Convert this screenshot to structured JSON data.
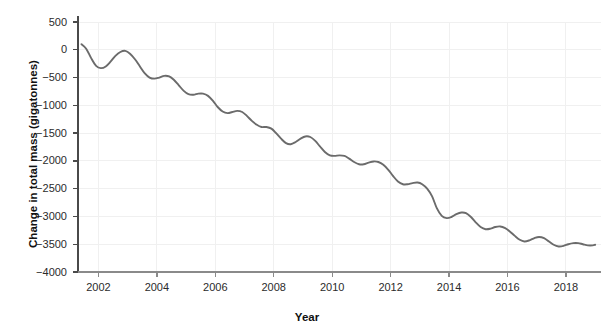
{
  "chart_data": {
    "type": "line",
    "title": "",
    "xlabel": "Year",
    "ylabel": "Change in total mass (gigatonnes)",
    "xlim": [
      2001.3,
      2019.2
    ],
    "ylim": [
      -4000,
      500
    ],
    "xticks": [
      2002,
      2004,
      2006,
      2008,
      2010,
      2012,
      2014,
      2016,
      2018
    ],
    "xtick_labels": [
      "2002",
      "2004",
      "2006",
      "2008",
      "2010",
      "2012",
      "2014",
      "2016",
      "2018"
    ],
    "yticks": [
      500,
      0,
      -500,
      -1000,
      -1500,
      -2000,
      -2500,
      -3000,
      -3500,
      -4000
    ],
    "ytick_labels": [
      "500",
      "0",
      "−500",
      "−1000",
      "−1500",
      "−2000",
      "−2500",
      "−3000",
      "−3500",
      "−4000"
    ],
    "grid": true,
    "legend": null,
    "line_color": "#6b6b6b",
    "grid_color": "#f0f0f0",
    "axis_color": "#4a4a4a",
    "series": [
      {
        "name": "Change in total mass",
        "x": [
          2001.42,
          2001.58,
          2001.75,
          2001.92,
          2002.08,
          2002.25,
          2002.42,
          2002.58,
          2002.75,
          2002.92,
          2003.08,
          2003.25,
          2003.42,
          2003.58,
          2003.75,
          2003.92,
          2004.08,
          2004.25,
          2004.42,
          2004.58,
          2004.75,
          2004.92,
          2005.08,
          2005.25,
          2005.42,
          2005.58,
          2005.75,
          2005.92,
          2006.08,
          2006.25,
          2006.42,
          2006.58,
          2006.75,
          2006.92,
          2007.08,
          2007.25,
          2007.42,
          2007.58,
          2007.75,
          2007.92,
          2008.08,
          2008.25,
          2008.42,
          2008.58,
          2008.75,
          2008.92,
          2009.08,
          2009.25,
          2009.42,
          2009.58,
          2009.75,
          2009.92,
          2010.08,
          2010.25,
          2010.42,
          2010.58,
          2010.75,
          2010.92,
          2011.08,
          2011.25,
          2011.42,
          2011.58,
          2011.75,
          2011.92,
          2012.08,
          2012.25,
          2012.42,
          2012.58,
          2012.75,
          2012.92,
          2013.08,
          2013.25,
          2013.42,
          2013.58,
          2013.75,
          2013.92,
          2014.08,
          2014.25,
          2014.42,
          2014.58,
          2014.75,
          2014.92,
          2015.08,
          2015.25,
          2015.42,
          2015.58,
          2015.75,
          2015.92,
          2016.08,
          2016.25,
          2016.42,
          2016.58,
          2016.75,
          2016.92,
          2017.08,
          2017.25,
          2017.42,
          2017.58,
          2017.75,
          2017.92,
          2018.08,
          2018.25,
          2018.42,
          2018.58,
          2018.75,
          2018.92,
          2019.0
        ],
        "y": [
          100,
          20,
          -150,
          -290,
          -330,
          -300,
          -210,
          -110,
          -40,
          -20,
          -70,
          -170,
          -300,
          -420,
          -500,
          -520,
          -500,
          -470,
          -480,
          -540,
          -640,
          -740,
          -800,
          -810,
          -790,
          -790,
          -830,
          -920,
          -1030,
          -1110,
          -1140,
          -1120,
          -1100,
          -1120,
          -1190,
          -1280,
          -1350,
          -1390,
          -1390,
          -1420,
          -1500,
          -1600,
          -1680,
          -1700,
          -1660,
          -1600,
          -1560,
          -1570,
          -1640,
          -1740,
          -1840,
          -1900,
          -1910,
          -1900,
          -1910,
          -1960,
          -2020,
          -2060,
          -2060,
          -2030,
          -2010,
          -2020,
          -2070,
          -2160,
          -2270,
          -2370,
          -2420,
          -2420,
          -2400,
          -2390,
          -2420,
          -2500,
          -2640,
          -2850,
          -2990,
          -3030,
          -3010,
          -2960,
          -2930,
          -2940,
          -3010,
          -3110,
          -3190,
          -3230,
          -3220,
          -3190,
          -3180,
          -3210,
          -3270,
          -3350,
          -3420,
          -3450,
          -3430,
          -3390,
          -3370,
          -3390,
          -3450,
          -3510,
          -3540,
          -3530,
          -3500,
          -3480,
          -3480,
          -3500,
          -3520,
          -3520,
          -3510
        ]
      }
    ]
  }
}
